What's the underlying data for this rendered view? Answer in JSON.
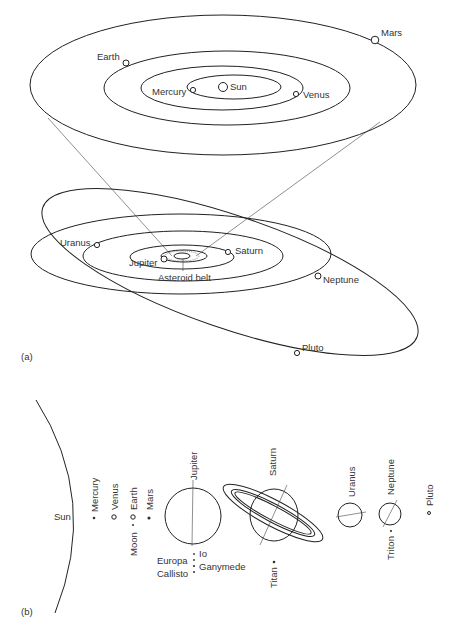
{
  "figure": {
    "panel_a": {
      "label": "(a)",
      "inner_system": {
        "sun": "Sun",
        "planets": [
          "Mercury",
          "Venus",
          "Earth",
          "Mars"
        ]
      },
      "outer_system": {
        "planets": [
          "Jupiter",
          "Saturn",
          "Uranus",
          "Neptune",
          "Pluto"
        ],
        "asteroid_belt": "Asteroid belt"
      }
    },
    "panel_b": {
      "label": "(b)",
      "sun": "Sun",
      "bodies": [
        "Mercury",
        "Venus",
        "Earth",
        "Moon",
        "Mars",
        "Jupiter",
        "Io",
        "Europa",
        "Ganymede",
        "Callisto",
        "Saturn",
        "Titan",
        "Uranus",
        "Neptune",
        "Triton",
        "Pluto"
      ]
    }
  }
}
